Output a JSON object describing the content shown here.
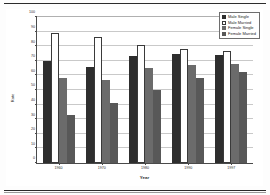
{
  "chart_data": {
    "type": "bar",
    "title": "",
    "xlabel": "Year",
    "ylabel": "Rate",
    "categories": [
      "1960",
      "1970",
      "1980",
      "1990",
      "1997"
    ],
    "ylim": [
      0,
      100
    ],
    "yticks": [
      0,
      10,
      20,
      30,
      40,
      50,
      60,
      70,
      80,
      90,
      100
    ],
    "grid": true,
    "legend_position": "top-right",
    "series": [
      {
        "name": "Male Single",
        "color": "#2e2e2e",
        "values": [
          70,
          66,
          73,
          75,
          74
        ]
      },
      {
        "name": "Male Married",
        "color": "#ffffff",
        "values": [
          89,
          86,
          81,
          78,
          77
        ]
      },
      {
        "name": "Female Single",
        "color": "#6b6b6b",
        "values": [
          58,
          57,
          65,
          67,
          68
        ]
      },
      {
        "name": "Female Married",
        "color": "#585858",
        "values": [
          33,
          41,
          50,
          58,
          62
        ]
      }
    ]
  }
}
